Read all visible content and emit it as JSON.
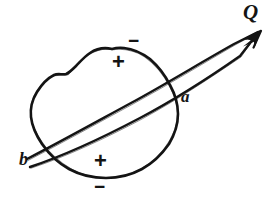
{
  "figure": {
    "kind": "hand-drawn-sketch",
    "background_color": "#ffffff",
    "ink_color": "#141414",
    "width": 276,
    "height": 204
  },
  "labels": {
    "source_point": "Q",
    "entry_point": "a",
    "exit_point": "b"
  },
  "signs": {
    "interior_top": "+",
    "interior_bottom": "+",
    "exterior_top": "−",
    "exterior_bottom": "−"
  },
  "annotations": [
    {
      "id": "q-label",
      "text": "Q",
      "x": 243,
      "y": 2,
      "role": "point-label"
    },
    {
      "id": "a-label",
      "text": "a",
      "x": 181,
      "y": 88,
      "role": "point-label"
    },
    {
      "id": "b-label",
      "text": "b",
      "x": 19,
      "y": 150,
      "role": "point-label"
    },
    {
      "id": "plus-top",
      "text": "+",
      "x": 112,
      "y": 54,
      "role": "sign-interior"
    },
    {
      "id": "plus-bottom",
      "text": "+",
      "x": 94,
      "y": 153,
      "role": "sign-interior"
    },
    {
      "id": "minus-top",
      "text": "−",
      "x": 128,
      "y": 31,
      "role": "sign-exterior"
    },
    {
      "id": "minus-bottom",
      "text": "−",
      "x": 94,
      "y": 179,
      "role": "sign-exterior"
    }
  ],
  "shapes": {
    "blob_label": "closed irregular region outline",
    "beam_label": "narrow wedge beam through region",
    "arrow_label": "arrowhead at Q"
  }
}
